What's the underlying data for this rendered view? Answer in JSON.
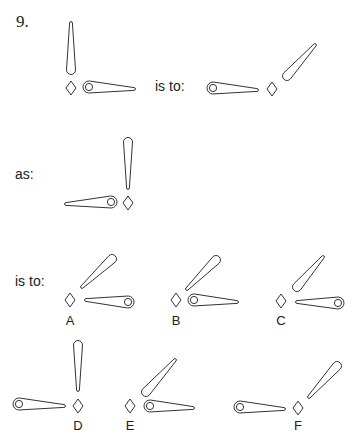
{
  "question": {
    "number": "9.",
    "phrase_is_to_1": "is to:",
    "phrase_as": "as:",
    "phrase_is_to_2": "is to:"
  },
  "options": [
    {
      "label": "A"
    },
    {
      "label": "B"
    },
    {
      "label": "C"
    },
    {
      "label": "D"
    },
    {
      "label": "E"
    },
    {
      "label": "F"
    }
  ],
  "figures": [
    {
      "id": "stem-1",
      "diamond": [
        71,
        88
      ],
      "hands": [
        {
          "narrow": [
            71,
            23
          ],
          "wide": [
            71,
            70
          ],
          "hole": false
        },
        {
          "narrow": [
            134,
            89
          ],
          "wide": [
            89,
            87
          ],
          "hole": true
        }
      ]
    },
    {
      "id": "stem-2",
      "diamond": [
        272,
        89
      ],
      "hands": [
        {
          "narrow": [
            257,
            90
          ],
          "wide": [
            213,
            88
          ],
          "hole": true
        },
        {
          "narrow": [
            315,
            45
          ],
          "wide": [
            287,
            76
          ],
          "hole": false
        }
      ]
    },
    {
      "id": "stem-3",
      "diamond": [
        128,
        203
      ],
      "hands": [
        {
          "narrow": [
            128,
            188
          ],
          "wide": [
            128,
            142
          ],
          "hole": false
        },
        {
          "narrow": [
            66,
            204
          ],
          "wide": [
            111,
            202
          ],
          "hole": true
        }
      ]
    },
    {
      "id": "option-a",
      "diamond": [
        70,
        300
      ],
      "hands": [
        {
          "narrow": [
            82,
            287
          ],
          "wide": [
            112,
            259
          ],
          "hole": false
        },
        {
          "narrow": [
            86,
            300
          ],
          "wide": [
            128,
            302
          ],
          "hole": true
        }
      ]
    },
    {
      "id": "option-b",
      "diamond": [
        176,
        300
      ],
      "hands": [
        {
          "narrow": [
            187,
            289
          ],
          "wide": [
            216,
            260
          ],
          "hole": false
        },
        {
          "narrow": [
            237,
            302
          ],
          "wide": [
            194,
            300
          ],
          "hole": true
        }
      ]
    },
    {
      "id": "option-c",
      "diamond": [
        281,
        301
      ],
      "hands": [
        {
          "narrow": [
            323,
            257
          ],
          "wide": [
            297,
            287
          ],
          "hole": false
        },
        {
          "narrow": [
            297,
            302
          ],
          "wide": [
            338,
            303
          ],
          "hole": true
        }
      ]
    },
    {
      "id": "option-d",
      "diamond": [
        78,
        406
      ],
      "hands": [
        {
          "narrow": [
            78,
            390
          ],
          "wide": [
            78,
            345
          ],
          "hole": false
        },
        {
          "narrow": [
            64,
            406
          ],
          "wide": [
            19,
            404
          ],
          "hole": true
        }
      ]
    },
    {
      "id": "option-e",
      "diamond": [
        130,
        406
      ],
      "hands": [
        {
          "narrow": [
            175,
            360
          ],
          "wide": [
            146,
            392
          ],
          "hole": false
        },
        {
          "narrow": [
            193,
            408
          ],
          "wide": [
            150,
            406
          ],
          "hole": true
        }
      ]
    },
    {
      "id": "option-f",
      "diamond": [
        298,
        408
      ],
      "hands": [
        {
          "narrow": [
            309,
            397
          ],
          "wide": [
            337,
            366
          ],
          "hole": false
        },
        {
          "narrow": [
            284,
            409
          ],
          "wide": [
            240,
            407
          ],
          "hole": true
        }
      ]
    }
  ]
}
